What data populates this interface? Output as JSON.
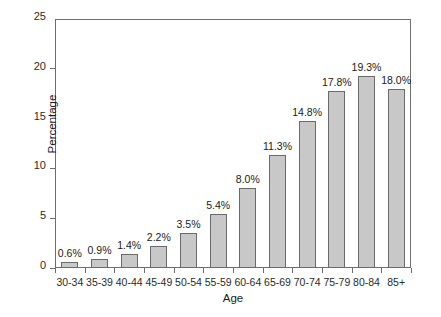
{
  "chart_data": {
    "type": "bar",
    "title": "",
    "xlabel": "Age",
    "ylabel": "Percentage",
    "categories": [
      "30-34",
      "35-39",
      "40-44",
      "45-49",
      "50-54",
      "55-59",
      "60-64",
      "65-69",
      "70-74",
      "75-79",
      "80-84",
      "85+"
    ],
    "values": [
      0.6,
      0.9,
      1.4,
      2.2,
      3.5,
      5.4,
      8.0,
      11.3,
      14.8,
      17.8,
      19.3,
      18.0
    ],
    "data_labels": [
      "0.6%",
      "0.9%",
      "1.4%",
      "2.2%",
      "3.5%",
      "5.4%",
      "8.0%",
      "11.3%",
      "14.8%",
      "17.8%",
      "19.3%",
      "18.0%"
    ],
    "ylim": [
      0,
      25
    ],
    "yticks": [
      0,
      5,
      10,
      15,
      20,
      25
    ],
    "ytick_labels": [
      "0",
      "5",
      "10",
      "15",
      "20",
      "25"
    ],
    "grid": false,
    "legend": false,
    "bar_color": "#c8c8c8",
    "bar_border_color": "#6a6a6a",
    "axis_color": "#6e6e6e",
    "text_color": "#1a1a1a"
  }
}
